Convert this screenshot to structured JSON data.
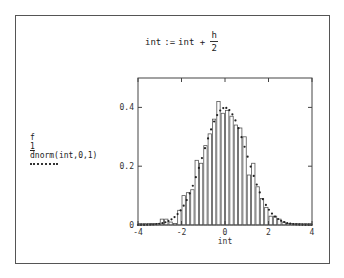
{
  "equation": {
    "lhs": "int",
    "assign": ":=",
    "rhs": "int +",
    "numerator": "h",
    "denominator": "2"
  },
  "legend": {
    "series1_name": "f",
    "series1_index": "1",
    "series2_name": "dnorm(int,0,1)",
    "series2_style": "dotted"
  },
  "chart_data": {
    "type": "bar",
    "title": "",
    "xlabel": "int",
    "ylabel": "",
    "xlim": [
      -4,
      4
    ],
    "ylim": [
      0,
      0.5
    ],
    "xticks": [
      "-4",
      "-2",
      "0",
      "2",
      "4"
    ],
    "yticks": [
      "0",
      "0.2",
      "0.4"
    ],
    "bin_width": 0.2,
    "grid": false,
    "legend_position": "left",
    "series": [
      {
        "name": "f1",
        "style": "histogram",
        "bin_centers": [
          -3.9,
          -3.7,
          -3.5,
          -3.3,
          -3.1,
          -2.9,
          -2.7,
          -2.5,
          -2.3,
          -2.1,
          -1.9,
          -1.7,
          -1.5,
          -1.3,
          -1.1,
          -0.9,
          -0.7,
          -0.5,
          -0.3,
          -0.1,
          0.1,
          0.3,
          0.5,
          0.7,
          0.9,
          1.1,
          1.3,
          1.5,
          1.7,
          1.9,
          2.1,
          2.3,
          2.5,
          2.7,
          2.9,
          3.1,
          3.3,
          3.5,
          3.7,
          3.9
        ],
        "values": [
          0.005,
          0.005,
          0.005,
          0.005,
          0.005,
          0.02,
          0.02,
          0.01,
          0.005,
          0.05,
          0.1,
          0.11,
          0.12,
          0.22,
          0.21,
          0.27,
          0.31,
          0.36,
          0.42,
          0.38,
          0.39,
          0.37,
          0.34,
          0.33,
          0.3,
          0.17,
          0.21,
          0.13,
          0.09,
          0.06,
          0.03,
          0.03,
          0.02,
          0.01,
          0.005,
          0.005,
          0.005,
          0.005,
          0.005,
          0.005
        ]
      },
      {
        "name": "dnorm(int,0,1)",
        "style": "dotted-line",
        "function": "standard normal pdf",
        "peak": 0.399
      }
    ]
  }
}
